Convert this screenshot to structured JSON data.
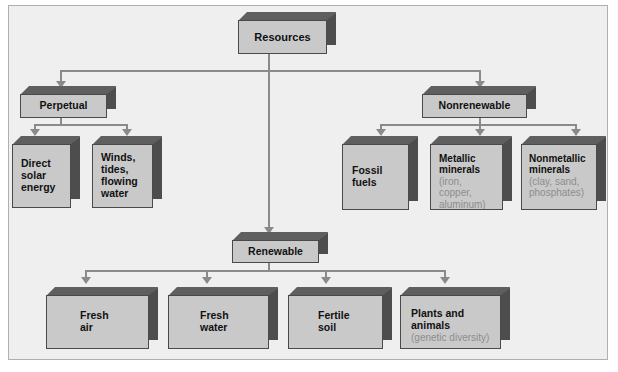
{
  "diagram": {
    "title": "Resources",
    "root": {
      "label": "Resources"
    },
    "branches": [
      {
        "id": "perpetual",
        "label": "Perpetual",
        "children": [
          {
            "id": "direct-solar-energy",
            "label": "Direct\nsolar\nenergy",
            "sub": ""
          },
          {
            "id": "winds-tides-flowing-water",
            "label": "Winds,\ntides,\nflowing\nwater",
            "sub": ""
          }
        ]
      },
      {
        "id": "nonrenewable",
        "label": "Nonrenewable",
        "children": [
          {
            "id": "fossil-fuels",
            "label": "Fossil\nfuels",
            "sub": ""
          },
          {
            "id": "metallic-minerals",
            "label": "Metallic\nminerals",
            "sub": "(iron,\ncopper,\naluminum)"
          },
          {
            "id": "nonmetallic-minerals",
            "label": "Nonmetallic\nminerals",
            "sub": "(clay, sand,\nphosphates)"
          }
        ]
      },
      {
        "id": "renewable",
        "label": "Renewable",
        "children": [
          {
            "id": "fresh-air",
            "label": "Fresh\nair",
            "sub": ""
          },
          {
            "id": "fresh-water",
            "label": "Fresh\nwater",
            "sub": ""
          },
          {
            "id": "fertile-soil",
            "label": "Fertile\nsoil",
            "sub": ""
          },
          {
            "id": "plants-and-animals",
            "label": "Plants and\nanimals",
            "sub": "(genetic diversity)"
          }
        ]
      }
    ],
    "colors": {
      "box_face": "#c9c9c9",
      "box_top": "#5f5f5f",
      "box_side": "#4d4d4d",
      "box_outline": "#4a4a4a",
      "connector": "#8a8a8a",
      "label_text": "#111111",
      "sub_text": "#8d8d8d",
      "canvas": "#efefef",
      "frame_border": "#b0b0b0",
      "page_background": "#ffffff"
    }
  }
}
